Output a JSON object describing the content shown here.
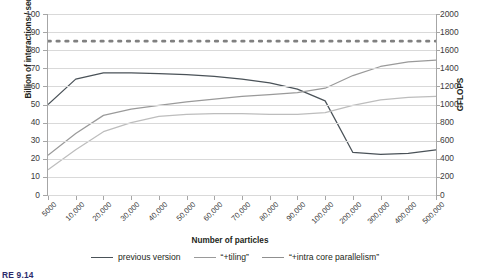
{
  "chart_data": {
    "type": "line",
    "title": "",
    "xlabel": "Number of particles",
    "ylabel": "Billion of interactions / second",
    "y2label": "GFLOPS",
    "categories": [
      "5000",
      "10,000",
      "20,000",
      "30,000",
      "40,000",
      "50,000",
      "60,000",
      "70,000",
      "80,000",
      "90,000",
      "100,000",
      "200,000",
      "300,000",
      "400,000",
      "500,000"
    ],
    "ylim": [
      0,
      100
    ],
    "yticks": [
      0,
      10,
      20,
      30,
      40,
      50,
      60,
      70,
      80,
      90,
      100
    ],
    "y2lim": [
      0,
      2000
    ],
    "y2ticks": [
      0,
      200,
      400,
      600,
      800,
      1000,
      1200,
      1400,
      1600,
      1800,
      2000
    ],
    "grid": true,
    "legend_position": "bottom",
    "series": [
      {
        "name": "previous version",
        "color": "#4a5258",
        "style": "solid",
        "values": [
          50,
          64,
          67.5,
          67.5,
          67,
          66.5,
          65.5,
          64,
          62,
          58.5,
          52,
          23.5,
          22.5,
          23,
          25
        ]
      },
      {
        "name": "“+tiling”",
        "color": "#9a9a9a",
        "style": "solid",
        "values": [
          22,
          34,
          44,
          47.5,
          49.5,
          51.5,
          53,
          54.5,
          55.5,
          56.5,
          59,
          66,
          71,
          73.5,
          74.5
        ]
      },
      {
        "name": "“+intra core parallelism”",
        "color": "#bdbdbd",
        "style": "solid",
        "values": [
          14,
          25,
          35,
          40,
          43.5,
          44.5,
          45,
          45,
          44.5,
          44.5,
          45.5,
          49.5,
          52.5,
          54,
          54.5
        ]
      },
      {
        "name": "peak-performance-reference",
        "color": "#808080",
        "style": "dotted",
        "values": [
          85,
          85,
          85,
          85,
          85,
          85,
          85,
          85,
          85,
          85,
          85,
          85,
          85,
          85,
          85
        ]
      }
    ]
  },
  "legend": {
    "items": [
      {
        "label": "previous version",
        "color": "#4a5258"
      },
      {
        "label": "“+tiling”",
        "color": "#9a9a9a"
      },
      {
        "label": "“+intra core parallelism”",
        "color": "#8f8f8f"
      }
    ]
  },
  "caption": "RE 9.14"
}
